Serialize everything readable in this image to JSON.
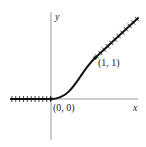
{
  "figure": {
    "x_axis_label": "x",
    "y_axis_label": "y",
    "points": [
      {
        "label": "(0, 0)",
        "x": 0,
        "y": 0
      },
      {
        "label": "(1, 1)",
        "x": 1,
        "y": 1
      }
    ],
    "curve": "smooth transition: y = 0 for x ≤ 0, y = x for x ≥ 1, smooth S-shaped connector between",
    "hatched_segments": [
      "x ≤ 0 along y = 0",
      "x ≥ 1 along y = x"
    ],
    "colors": {
      "axis": "#888888",
      "curve": "#111111"
    }
  }
}
